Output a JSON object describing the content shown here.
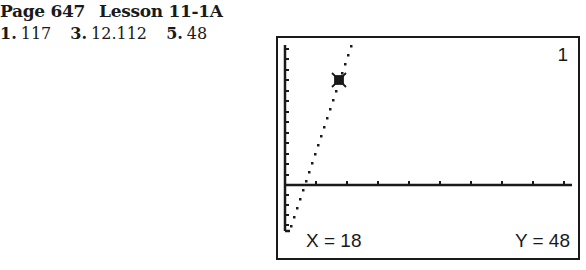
{
  "heading": {
    "page": "Page 647",
    "lesson": "Lesson 11-1A"
  },
  "answers": [
    {
      "number": "1.",
      "value": "117"
    },
    {
      "number": "3.",
      "value": "12.112"
    },
    {
      "number": "5.",
      "value": "48"
    }
  ],
  "calculator_screen": {
    "plot_index": "1",
    "x_readout": "X = 18",
    "y_readout": "Y = 48",
    "cursor": {
      "x": 18,
      "y": 48
    }
  }
}
